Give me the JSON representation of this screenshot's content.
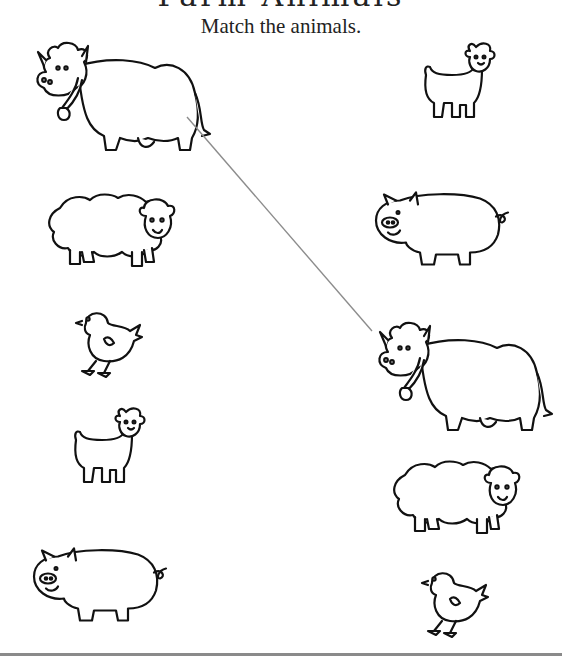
{
  "worksheet": {
    "title_partial": "Farm Animals",
    "instruction": "Match the animals."
  },
  "left_column": [
    {
      "animal": "cow",
      "icon": "cow-icon"
    },
    {
      "animal": "sheep",
      "icon": "sheep-icon"
    },
    {
      "animal": "chick",
      "icon": "chick-icon"
    },
    {
      "animal": "goat",
      "icon": "goat-icon"
    },
    {
      "animal": "pig",
      "icon": "pig-icon"
    }
  ],
  "right_column": [
    {
      "animal": "goat",
      "icon": "goat-icon"
    },
    {
      "animal": "pig",
      "icon": "pig-icon"
    },
    {
      "animal": "cow",
      "icon": "cow-icon"
    },
    {
      "animal": "sheep",
      "icon": "sheep-icon"
    },
    {
      "animal": "chick",
      "icon": "chick-icon"
    }
  ],
  "matches_drawn": [
    {
      "from": "left.cow",
      "to": "right.cow",
      "color": "#8c8c8c"
    }
  ],
  "colors": {
    "ink": "#111111",
    "match_line": "#8c8c8c",
    "background": "#ffffff",
    "rule": "#8a8a8a"
  }
}
